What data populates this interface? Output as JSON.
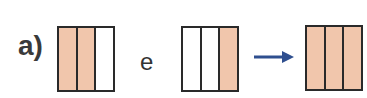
{
  "item_label": "a)",
  "conjunction": "e",
  "colors": {
    "filled": "#F1C6AC",
    "empty": "#FFFFFF",
    "arrow": "#2F4F8F"
  },
  "fractions": [
    {
      "name": "first",
      "parts": 3,
      "filled": [
        true,
        true,
        false
      ]
    },
    {
      "name": "second",
      "parts": 3,
      "filled": [
        false,
        false,
        true
      ]
    },
    {
      "name": "result",
      "parts": 3,
      "filled": [
        true,
        true,
        true
      ]
    }
  ]
}
